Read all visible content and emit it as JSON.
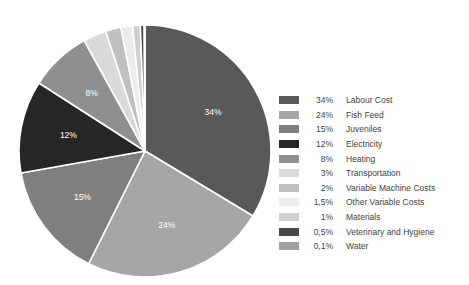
{
  "chart_data": {
    "type": "pie",
    "title": "",
    "legend_position": "right",
    "start_angle_deg": 0,
    "direction": "clockwise",
    "center": {
      "x": 145,
      "y": 151
    },
    "radius": 126,
    "categories": [
      "Labour Cost",
      "Fish Feed",
      "Juveniles",
      "Electricity",
      "Heating",
      "Transportation",
      "Variable Machine Costs",
      "Other Variable Costs",
      "Materials",
      "Veterinary and Hygiene",
      "Water"
    ],
    "values": [
      34,
      24,
      15,
      12,
      8,
      3,
      2,
      1.5,
      1,
      0.5,
      0.1
    ],
    "value_labels": [
      "34%",
      "24%",
      "15%",
      "12%",
      "8%",
      "3%",
      "2%",
      "1,5%",
      "1%",
      "0,5%",
      "0,1%"
    ],
    "colors": [
      "#595959",
      "#a6a6a6",
      "#7f7f7f",
      "#262626",
      "#8f8f8f",
      "#d9d9d9",
      "#bfbfbf",
      "#ececec",
      "#cfcfcf",
      "#4a4a4a",
      "#a0a0a0"
    ],
    "slice_label_shown": [
      true,
      true,
      true,
      true,
      true,
      false,
      false,
      false,
      false,
      false,
      false
    ]
  },
  "legend": {
    "items": [
      {
        "percent": "34%",
        "label": "Labour Cost",
        "color": "#595959"
      },
      {
        "percent": "24%",
        "label": "Fish Feed",
        "color": "#a6a6a6"
      },
      {
        "percent": "15%",
        "label": "Juveniles",
        "color": "#7f7f7f"
      },
      {
        "percent": "12%",
        "label": "Electricity",
        "color": "#262626"
      },
      {
        "percent": "8%",
        "label": "Heating",
        "color": "#8f8f8f"
      },
      {
        "percent": "3%",
        "label": "Transportation",
        "color": "#d9d9d9"
      },
      {
        "percent": "2%",
        "label": "Variable Machine Costs",
        "color": "#bfbfbf"
      },
      {
        "percent": "1,5%",
        "label": "Other Variable Costs",
        "color": "#ececec"
      },
      {
        "percent": "1%",
        "label": "Materials",
        "color": "#cfcfcf"
      },
      {
        "percent": "0,5%",
        "label": "Veterinary and Hygiene",
        "color": "#4a4a4a"
      },
      {
        "percent": "0,1%",
        "label": "Water",
        "color": "#a0a0a0"
      }
    ]
  }
}
